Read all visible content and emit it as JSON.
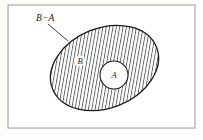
{
  "figure": {
    "caption_labels": {
      "difference": "B−A",
      "set_b": "B",
      "set_a": "A"
    },
    "colors": {
      "frame_stroke": "#9a9a9a",
      "outline_stroke": "#1a1a1a",
      "hatch_stroke": "#2b2b2b",
      "leader_stroke": "#2b2b2b",
      "page_background": "#fdfdfc",
      "panel_background": "#ffffff",
      "inner_fill": "#ffffff"
    },
    "frame": {
      "x": 8,
      "y": 5,
      "width": 187,
      "height": 123
    },
    "ellipse_b": {
      "cx": 104.5,
      "cy": 68,
      "rx": 56,
      "ry": 40,
      "rotation": -22
    },
    "circle_a": {
      "cx": 114,
      "cy": 75,
      "r": 14
    },
    "hatch": {
      "spacing": 3.3,
      "angle": 10,
      "stroke_width": 0.75
    },
    "leader_line": {
      "x1": 48,
      "y1": 24,
      "x2": 68,
      "y2": 41
    },
    "label_positions": {
      "difference": {
        "x": 36,
        "y": 21
      },
      "set_b": {
        "x": 80,
        "y": 64
      },
      "set_a": {
        "x": 114,
        "y": 78
      }
    }
  }
}
